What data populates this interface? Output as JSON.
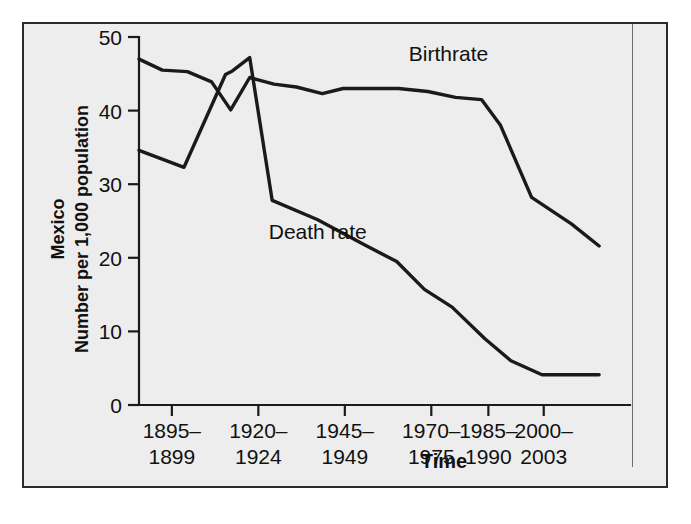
{
  "figure": {
    "background_color": "#ededed",
    "frame_color": "#2b2b2b",
    "line_color": "#1a1a1a"
  },
  "chart_data": {
    "type": "line",
    "title": "",
    "subtitle": "",
    "xlabel": "Time",
    "ylabel": "Number per 1,000 population",
    "ylabel_outer": "Mexico",
    "categories": [
      "1895–1899",
      "1920–1924",
      "1945–1949",
      "1970–1975",
      "1985–1990",
      "2000–2003"
    ],
    "xtick_labels_lines": [
      [
        "1895–",
        "1899"
      ],
      [
        "1920–",
        "1924"
      ],
      [
        "1945–",
        "1949"
      ],
      [
        "1970–",
        "1975"
      ],
      [
        "1985–",
        "1990"
      ],
      [
        "2000–",
        "2003"
      ]
    ],
    "ytick_labels": [
      "0",
      "10",
      "20",
      "30",
      "40",
      "50"
    ],
    "ytick_values": [
      0,
      10,
      20,
      30,
      40,
      50
    ],
    "ylim": [
      0,
      50
    ],
    "xlim": [
      0,
      5.4
    ],
    "grid": false,
    "legend_position": "inline-annotation",
    "series": [
      {
        "name": "Birthrate",
        "label_x": 3.12,
        "label_y": 46.8,
        "points": [
          {
            "x": 0.0,
            "y": 47.0
          },
          {
            "x": 0.27,
            "y": 45.5
          },
          {
            "x": 0.56,
            "y": 45.3
          },
          {
            "x": 0.84,
            "y": 43.9
          },
          {
            "x": 1.06,
            "y": 40.1
          },
          {
            "x": 1.28,
            "y": 44.5
          },
          {
            "x": 1.56,
            "y": 43.6
          },
          {
            "x": 1.82,
            "y": 43.2
          },
          {
            "x": 2.12,
            "y": 42.3
          },
          {
            "x": 2.36,
            "y": 43.0
          },
          {
            "x": 2.66,
            "y": 43.0
          },
          {
            "x": 3.0,
            "y": 43.0
          },
          {
            "x": 3.34,
            "y": 42.6
          },
          {
            "x": 3.66,
            "y": 41.8
          },
          {
            "x": 3.96,
            "y": 41.5
          },
          {
            "x": 4.18,
            "y": 38.0
          },
          {
            "x": 4.54,
            "y": 28.2
          },
          {
            "x": 5.0,
            "y": 24.6
          },
          {
            "x": 5.32,
            "y": 21.6
          }
        ]
      },
      {
        "name": "Death rate",
        "label_x": 1.5,
        "label_y": 22.6,
        "points": [
          {
            "x": 0.0,
            "y": 34.6
          },
          {
            "x": 0.52,
            "y": 32.3
          },
          {
            "x": 1.0,
            "y": 44.9
          },
          {
            "x": 1.08,
            "y": 45.4
          },
          {
            "x": 1.28,
            "y": 47.2
          },
          {
            "x": 1.54,
            "y": 27.8
          },
          {
            "x": 2.06,
            "y": 25.2
          },
          {
            "x": 2.6,
            "y": 21.8
          },
          {
            "x": 2.98,
            "y": 19.5
          },
          {
            "x": 3.3,
            "y": 15.7
          },
          {
            "x": 3.62,
            "y": 13.3
          },
          {
            "x": 4.0,
            "y": 9.0
          },
          {
            "x": 4.3,
            "y": 6.0
          },
          {
            "x": 4.66,
            "y": 4.1
          },
          {
            "x": 5.32,
            "y": 4.1
          }
        ]
      }
    ]
  }
}
